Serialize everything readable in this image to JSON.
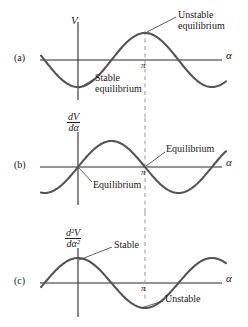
{
  "figure": {
    "stroke_color": "#555555",
    "axis_color": "#2b2b2b",
    "dash_color": "#9a9a9a",
    "text_color": "#1a1a1a"
  },
  "panels": [
    {
      "key": "(a)",
      "y_axis_label": "V",
      "y_axis_label_kind": "plain",
      "x_axis_label": "α",
      "tick_label": "π",
      "annotations": [
        {
          "name": "unstable-equilibrium",
          "line1": "Unstable",
          "line2": "equilibrium"
        },
        {
          "name": "stable-equilibrium",
          "line1": "Stable",
          "line2": "equilibrium"
        }
      ]
    },
    {
      "key": "(b)",
      "y_axis_label_numerator": "dV",
      "y_axis_label_denominator": "dα",
      "y_axis_label_kind": "fraction",
      "x_axis_label": "α",
      "tick_label": "π",
      "annotations": [
        {
          "name": "equilibrium-upper",
          "line1": "Equilibrium",
          "line2": ""
        },
        {
          "name": "equilibrium-lower",
          "line1": "Equilibrium",
          "line2": ""
        }
      ]
    },
    {
      "key": "(c)",
      "y_axis_label_numerator": "d²V",
      "y_axis_label_denominator": "dα²",
      "y_axis_label_kind": "fraction",
      "x_axis_label": "α",
      "tick_label": "π",
      "annotations": [
        {
          "name": "stable",
          "line1": "Stable",
          "line2": ""
        },
        {
          "name": "unstable",
          "line1": "Unstable",
          "line2": ""
        }
      ]
    }
  ],
  "chart_data": {
    "type": "line",
    "xlabel": "α",
    "grid": false,
    "legend": "none",
    "xlim": [
      -0.7854,
      8.6394
    ],
    "x_ticks": [
      3.14159
    ],
    "x_tick_labels": [
      "π"
    ],
    "series": [
      {
        "name": "V",
        "panel": "(a)",
        "ylabel": "V",
        "expression": "-cos(alpha)",
        "ylim": [
          -1.15,
          1.15
        ],
        "x": [
          -0.785,
          0.0,
          0.785,
          1.571,
          2.356,
          3.142,
          3.927,
          4.712,
          5.498,
          6.283,
          7.069,
          7.854,
          8.639
        ],
        "y": [
          -0.707,
          -1.0,
          -0.707,
          0.0,
          0.707,
          1.0,
          0.707,
          0.0,
          -0.707,
          -1.0,
          -0.707,
          0.0,
          0.707
        ]
      },
      {
        "name": "dV/dα",
        "panel": "(b)",
        "ylabel": "dV/dα",
        "expression": "sin(alpha)",
        "ylim": [
          -1.15,
          1.15
        ],
        "x": [
          -0.785,
          0.0,
          0.785,
          1.571,
          2.356,
          3.142,
          3.927,
          4.712,
          5.498,
          6.283,
          7.069,
          7.854,
          8.639
        ],
        "y": [
          -0.707,
          0.0,
          0.707,
          1.0,
          0.707,
          0.0,
          -0.707,
          -1.0,
          -0.707,
          0.0,
          0.707,
          1.0,
          0.707
        ]
      },
      {
        "name": "d²V/dα²",
        "panel": "(c)",
        "ylabel": "d²V/dα²",
        "expression": "cos(alpha)",
        "ylim": [
          -1.15,
          1.15
        ],
        "x": [
          -0.785,
          0.0,
          0.785,
          1.571,
          2.356,
          3.142,
          3.927,
          4.712,
          5.498,
          6.283,
          7.069,
          7.854,
          8.639
        ],
        "y": [
          0.707,
          1.0,
          0.707,
          0.0,
          -0.707,
          -1.0,
          -0.707,
          0.0,
          0.707,
          1.0,
          0.707,
          0.0,
          -0.707
        ]
      }
    ],
    "annotations": [
      {
        "panel": "(a)",
        "text": "Unstable equilibrium",
        "at_x": 3.14159,
        "at_y": 1.0
      },
      {
        "panel": "(a)",
        "text": "Stable equilibrium",
        "at_x": 0.0,
        "at_y": -1.0
      },
      {
        "panel": "(b)",
        "text": "Equilibrium",
        "at_x": 3.14159,
        "at_y": 0.0
      },
      {
        "panel": "(b)",
        "text": "Equilibrium",
        "at_x": 0.0,
        "at_y": 0.0
      },
      {
        "panel": "(c)",
        "text": "Stable",
        "at_x": 0.0,
        "at_y": 1.0
      },
      {
        "panel": "(c)",
        "text": "Unstable",
        "at_x": 3.14159,
        "at_y": -1.0
      }
    ]
  }
}
